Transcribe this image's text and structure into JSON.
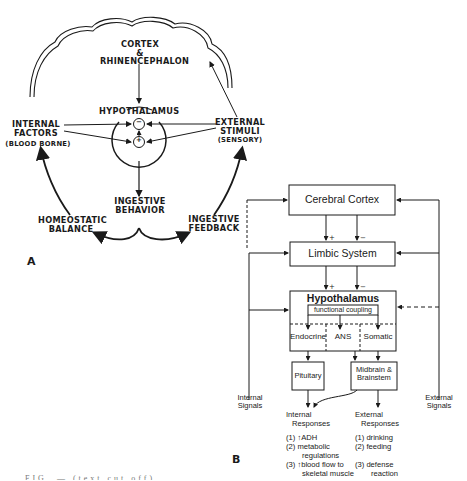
{
  "panel_a": {
    "label": "A",
    "cortex": [
      "CORTEX",
      "&",
      "RHINENCEPHALON"
    ],
    "hypothalamus": "HYPOTHALAMUS",
    "inhibit_symbol": "−",
    "excite_symbol": "+",
    "internal_factors": [
      "INTERNAL",
      "FACTORS"
    ],
    "internal_factors_note": "(BLOOD BORNE)",
    "external_stimuli": [
      "EXTERNAL",
      "STIMULI"
    ],
    "external_stimuli_note": "(SENSORY)",
    "ingestive_behavior": [
      "INGESTIVE",
      "BEHAVIOR"
    ],
    "homeostatic_balance": [
      "HOMEOSTATIC",
      "BALANCE"
    ],
    "ingestive_feedback": [
      "INGESTIVE",
      "FEEDBACK"
    ]
  },
  "panel_b": {
    "label": "B",
    "cerebral_cortex": "Cerebral Cortex",
    "limbic_system": "Limbic System",
    "hypothalamus": "Hypothalamus",
    "functional_coupling": "functional coupling",
    "subdivisions": [
      "Endocrine",
      "ANS",
      "Somatic"
    ],
    "pituitary": "Pituitary",
    "midbrain": [
      "Midbrain &",
      "Brainstem"
    ],
    "plus": "+",
    "minus": "−",
    "internal_signals": [
      "Internal",
      "Signals"
    ],
    "external_signals": [
      "External",
      "Signals"
    ],
    "internal_responses": {
      "title": [
        "Internal",
        "Responses"
      ],
      "items": [
        "(1) ↑ADH",
        "(2) metabolic",
        "regulations",
        "(3) ↑blood flow to",
        "skeletal muscle"
      ]
    },
    "external_responses": {
      "title": [
        "External",
        "Responses"
      ],
      "items": [
        "(1) drinking",
        "(2) feeding",
        "(3) defense",
        "reaction"
      ]
    }
  },
  "caption": "FIG. — (text cut off)",
  "colors": {
    "ink": "#1a1a1a",
    "background": "#ffffff"
  }
}
